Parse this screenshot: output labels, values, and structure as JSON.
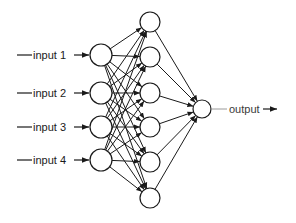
{
  "diagram": {
    "type": "feedforward-neural-network",
    "layers": [
      {
        "name": "input",
        "size": 4
      },
      {
        "name": "hidden",
        "size": 6
      },
      {
        "name": "output",
        "size": 1
      }
    ],
    "inputs": [
      {
        "label": "input 1"
      },
      {
        "label": "input 2"
      },
      {
        "label": "input 3"
      },
      {
        "label": "input 4"
      }
    ],
    "output": {
      "label": "output"
    },
    "colors": {
      "stroke": "#1a1a1a",
      "node_fill": "#ffffff",
      "background": "#ffffff",
      "output_line": "#9a9a9a"
    }
  }
}
